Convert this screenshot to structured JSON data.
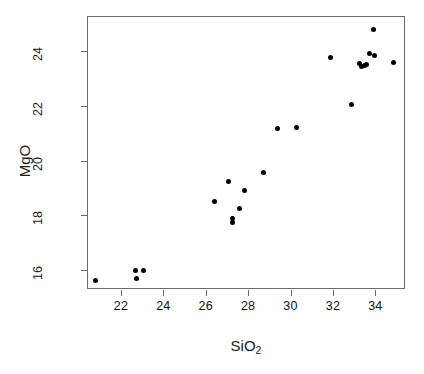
{
  "chart_data": {
    "type": "scatter",
    "title": "",
    "xlabel": "SiO2",
    "xlabel_base": "SiO",
    "xlabel_sub": "2",
    "ylabel": "MgO",
    "xlim": [
      20.4,
      35.4
    ],
    "ylim": [
      15.3,
      25.3
    ],
    "xticks": [
      22,
      24,
      26,
      28,
      30,
      32,
      34
    ],
    "xtick_labels": [
      "22",
      "24",
      "26",
      "28",
      "30",
      "32",
      "34"
    ],
    "yticks": [
      16,
      18,
      20,
      22,
      24
    ],
    "ytick_labels": [
      "16",
      "18",
      "20",
      "22",
      "24"
    ],
    "grid": false,
    "legend": null,
    "point_color": "#000000",
    "point_shape": "filled-circle",
    "box_color": "#6b6b6b",
    "background": "#ffffff",
    "x": [
      20.76,
      22.63,
      22.7,
      23.01,
      26.35,
      27.03,
      27.22,
      27.22,
      27.54,
      27.78,
      28.69,
      29.35,
      30.22,
      31.86,
      32.85,
      33.22,
      33.32,
      33.43,
      33.52,
      33.67,
      33.86,
      33.93,
      34.8
    ],
    "y": [
      15.66,
      16.03,
      15.73,
      16.03,
      18.54,
      19.27,
      17.92,
      17.78,
      18.3,
      18.94,
      19.6,
      21.22,
      21.24,
      23.8,
      22.08,
      23.6,
      23.5,
      23.52,
      23.55,
      23.95,
      24.85,
      23.88,
      23.62
    ],
    "points": [
      {
        "x": 20.76,
        "y": 15.66
      },
      {
        "x": 22.63,
        "y": 16.03
      },
      {
        "x": 22.7,
        "y": 15.73
      },
      {
        "x": 23.01,
        "y": 16.03
      },
      {
        "x": 26.35,
        "y": 18.54
      },
      {
        "x": 27.03,
        "y": 19.27
      },
      {
        "x": 27.22,
        "y": 17.92
      },
      {
        "x": 27.22,
        "y": 17.78
      },
      {
        "x": 27.54,
        "y": 18.3
      },
      {
        "x": 27.78,
        "y": 18.94
      },
      {
        "x": 28.69,
        "y": 19.6
      },
      {
        "x": 29.35,
        "y": 21.22
      },
      {
        "x": 30.22,
        "y": 21.24
      },
      {
        "x": 31.86,
        "y": 23.8
      },
      {
        "x": 32.85,
        "y": 22.08
      },
      {
        "x": 33.22,
        "y": 23.6
      },
      {
        "x": 33.32,
        "y": 23.5
      },
      {
        "x": 33.43,
        "y": 23.52
      },
      {
        "x": 33.52,
        "y": 23.55
      },
      {
        "x": 33.67,
        "y": 23.95
      },
      {
        "x": 33.86,
        "y": 24.85
      },
      {
        "x": 33.93,
        "y": 23.88
      },
      {
        "x": 34.8,
        "y": 23.62
      }
    ],
    "n_points": 23
  }
}
